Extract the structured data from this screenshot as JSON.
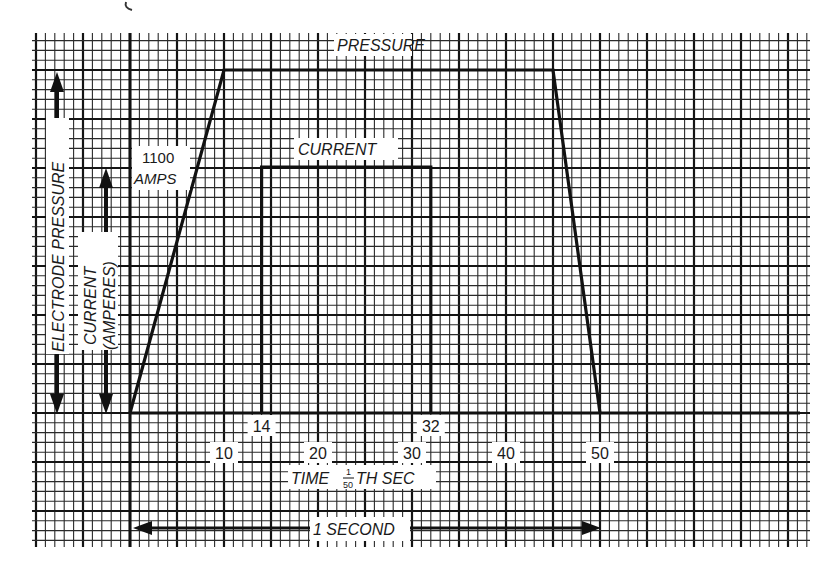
{
  "chart_data": {
    "type": "line",
    "title": "",
    "xlabel": "TIME 1/50TH SEC",
    "xlabel_parts": {
      "pre": "TIME ",
      "num": "1",
      "den": "50",
      "post": "TH SEC"
    },
    "ylabel_left": "ELECTRODE PRESSURE",
    "ylabel_right_line1": "CURRENT",
    "ylabel_right_line2": "(AMPERES)",
    "x_unit": "1/50 second",
    "xlim": [
      -10,
      72
    ],
    "grid": true,
    "x_ticks": [
      {
        "value": 10,
        "label": "10",
        "row": "lower"
      },
      {
        "value": 14,
        "label": "14",
        "row": "upper"
      },
      {
        "value": 20,
        "label": "20",
        "row": "lower"
      },
      {
        "value": 30,
        "label": "30",
        "row": "lower"
      },
      {
        "value": 32,
        "label": "32",
        "row": "upper"
      },
      {
        "value": 40,
        "label": "40",
        "row": "lower"
      },
      {
        "value": 50,
        "label": "50",
        "row": "lower"
      }
    ],
    "series": [
      {
        "name": "PRESSURE",
        "label": "PRESSURE",
        "x": [
          0,
          10,
          45,
          50
        ],
        "y": [
          0,
          1.0,
          1.0,
          0
        ],
        "note": "relative electrode pressure"
      },
      {
        "name": "CURRENT",
        "label": "CURRENT",
        "x": [
          14,
          14,
          32,
          32
        ],
        "y": [
          0,
          1100,
          1100,
          0
        ],
        "peak_label_line1": "1100",
        "peak_label_line2": "AMPS"
      }
    ],
    "annotations": [
      {
        "text": "1 SECOND",
        "type": "double-arrow",
        "from_x": 0,
        "to_x": 50
      }
    ]
  },
  "colors": {
    "ink": "#1a1a1a",
    "paper": "#ffffff",
    "grid_minor": "#2a2a2a",
    "grid_major": "#141414"
  }
}
